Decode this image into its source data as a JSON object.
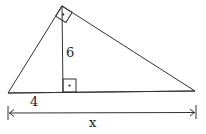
{
  "diagram": {
    "labels": {
      "altitude": "6",
      "left_segment": "4",
      "base_total": "x"
    },
    "right_angle_marks": [
      "top-vertex",
      "altitude-foot"
    ],
    "colors": {
      "stroke": "#333333",
      "text": "#222222",
      "background": "#ffffff"
    }
  }
}
